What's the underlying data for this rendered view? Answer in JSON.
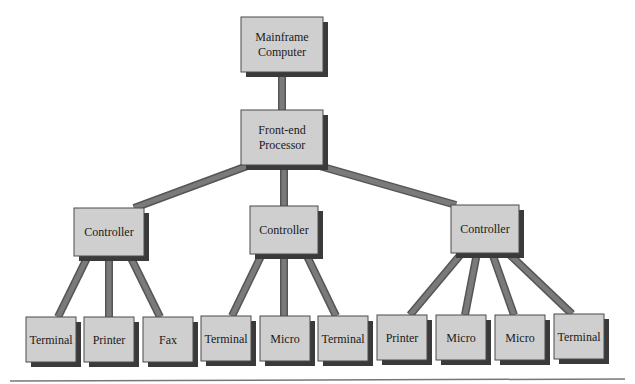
{
  "diagram": {
    "type": "hierarchy",
    "colors": {
      "box_fill": "#cfcfcf",
      "box_stroke": "#4a4a4a",
      "shadow": "#3a3a3a",
      "connector": "#7a7a7a",
      "connector_edge": "#555555",
      "baseline": "#777777"
    },
    "nodes": [
      {
        "id": "mainframe",
        "lines": [
          "Mainframe",
          "Computer"
        ],
        "x": 241,
        "y": 17,
        "w": 82,
        "h": 55
      },
      {
        "id": "fep",
        "lines": [
          "Front-end",
          "Processor"
        ],
        "x": 241,
        "y": 110,
        "w": 82,
        "h": 55
      },
      {
        "id": "ctrl1",
        "lines": [
          "Controller"
        ],
        "x": 74,
        "y": 208,
        "w": 70,
        "h": 48
      },
      {
        "id": "ctrl2",
        "lines": [
          "Controller"
        ],
        "x": 250,
        "y": 206,
        "w": 68,
        "h": 48
      },
      {
        "id": "ctrl3",
        "lines": [
          "Controller"
        ],
        "x": 451,
        "y": 205,
        "w": 68,
        "h": 48
      },
      {
        "id": "t1",
        "lines": [
          "Terminal"
        ],
        "x": 26,
        "y": 317,
        "w": 50,
        "h": 45
      },
      {
        "id": "p1",
        "lines": [
          "Printer"
        ],
        "x": 84,
        "y": 317,
        "w": 50,
        "h": 45
      },
      {
        "id": "f1",
        "lines": [
          "Fax"
        ],
        "x": 143,
        "y": 317,
        "w": 50,
        "h": 45
      },
      {
        "id": "t2",
        "lines": [
          "Terminal"
        ],
        "x": 201,
        "y": 316,
        "w": 50,
        "h": 45
      },
      {
        "id": "m1",
        "lines": [
          "Micro"
        ],
        "x": 260,
        "y": 316,
        "w": 50,
        "h": 45
      },
      {
        "id": "t3",
        "lines": [
          "Terminal"
        ],
        "x": 318,
        "y": 316,
        "w": 50,
        "h": 45
      },
      {
        "id": "p2",
        "lines": [
          "Printer"
        ],
        "x": 377,
        "y": 315,
        "w": 50,
        "h": 45
      },
      {
        "id": "m2",
        "lines": [
          "Micro"
        ],
        "x": 436,
        "y": 315,
        "w": 50,
        "h": 45
      },
      {
        "id": "m3",
        "lines": [
          "Micro"
        ],
        "x": 495,
        "y": 315,
        "w": 50,
        "h": 45
      },
      {
        "id": "t4",
        "lines": [
          "Terminal"
        ],
        "x": 554,
        "y": 314,
        "w": 50,
        "h": 45
      }
    ],
    "edges": [
      {
        "from": "mainframe",
        "to": "fep",
        "x1": 282,
        "y1": 72,
        "x2": 282,
        "y2": 110
      },
      {
        "from": "fep",
        "to": "ctrl1",
        "x1": 250,
        "y1": 165,
        "x2": 134,
        "y2": 208
      },
      {
        "from": "fep",
        "to": "ctrl2",
        "x1": 284,
        "y1": 165,
        "x2": 284,
        "y2": 206
      },
      {
        "from": "fep",
        "to": "ctrl3",
        "x1": 316,
        "y1": 165,
        "x2": 456,
        "y2": 205
      },
      {
        "from": "ctrl1",
        "to": "t1",
        "x1": 88,
        "y1": 256,
        "x2": 58,
        "y2": 317
      },
      {
        "from": "ctrl1",
        "to": "p1",
        "x1": 109,
        "y1": 256,
        "x2": 109,
        "y2": 317
      },
      {
        "from": "ctrl1",
        "to": "f1",
        "x1": 130,
        "y1": 256,
        "x2": 160,
        "y2": 317
      },
      {
        "from": "ctrl2",
        "to": "t2",
        "x1": 262,
        "y1": 254,
        "x2": 232,
        "y2": 316
      },
      {
        "from": "ctrl2",
        "to": "m1",
        "x1": 284,
        "y1": 254,
        "x2": 284,
        "y2": 316
      },
      {
        "from": "ctrl2",
        "to": "t3",
        "x1": 306,
        "y1": 254,
        "x2": 336,
        "y2": 316
      },
      {
        "from": "ctrl3",
        "to": "p2",
        "x1": 462,
        "y1": 253,
        "x2": 410,
        "y2": 315
      },
      {
        "from": "ctrl3",
        "to": "m2",
        "x1": 477,
        "y1": 253,
        "x2": 465,
        "y2": 315
      },
      {
        "from": "ctrl3",
        "to": "m3",
        "x1": 492,
        "y1": 253,
        "x2": 514,
        "y2": 315
      },
      {
        "from": "ctrl3",
        "to": "t4",
        "x1": 508,
        "y1": 253,
        "x2": 572,
        "y2": 314
      }
    ],
    "baseline": {
      "x1": 10,
      "y1": 381,
      "x2": 625,
      "y2": 379
    }
  }
}
